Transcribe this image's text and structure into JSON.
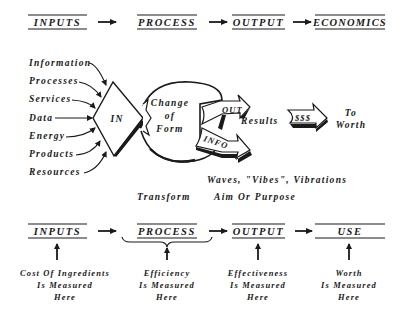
{
  "top_flow": {
    "steps": [
      "INPUTS",
      "PROCESS",
      "OUTPUT",
      "ECONOMICS"
    ]
  },
  "inputs_list": [
    "Information",
    "Processes",
    "Services",
    "Data",
    "Energy",
    "Products",
    "Resources"
  ],
  "center": {
    "in_label": "IN",
    "change_line1": "Change",
    "change_line2": "of",
    "change_line3": "Form",
    "out_label": "OUT",
    "info_label": "INFO",
    "results_label": "Results",
    "money_label": "$$$",
    "to_label": "To",
    "worth_label": "Worth",
    "waves_label": "Waves, \"Vibes\", Vibrations",
    "transform_label": "Transform",
    "aim_label": "Aim Or Purpose"
  },
  "bottom_flow": {
    "steps": [
      "INPUTS",
      "PROCESS",
      "OUTPUT",
      "USE"
    ],
    "measures": [
      {
        "line1": "Cost Of Ingredients",
        "line2": "Is Measured",
        "line3": "Here"
      },
      {
        "line1": "Efficiency",
        "line2": "Is Measured",
        "line3": "Here"
      },
      {
        "line1": "Effectiveness",
        "line2": "Is Measured",
        "line3": "Here"
      },
      {
        "line1": "Worth",
        "line2": "Is Measured",
        "line3": "Here"
      }
    ]
  }
}
